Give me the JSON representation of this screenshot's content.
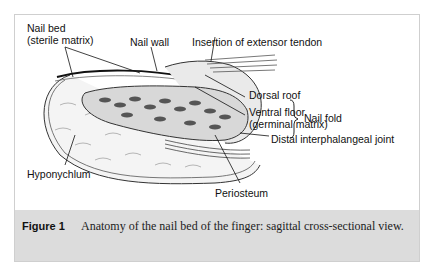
{
  "figure": {
    "labels": {
      "nail_bed": "Nail bed",
      "sterile_matrix": "(sterile matrix)",
      "nail_wall": "Nail wall",
      "insertion": "Insertion of extensor tendon",
      "dorsal_roof": "Dorsal roof",
      "ventral_floor": "Ventral floor",
      "germinal_matrix": "(germinal matrix)",
      "nail_fold": "Nail fold",
      "dip_joint": "Distal interphalangeal joint",
      "hyponychium": "Hyponychlum",
      "periosteum": "Periosteum"
    }
  },
  "caption": {
    "number": "Figure 1",
    "text": "Anatomy of the nail bed of the finger: sagittal cross-sectional view."
  }
}
